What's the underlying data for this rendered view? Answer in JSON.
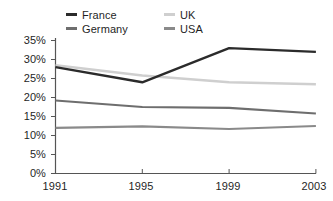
{
  "chart_data": {
    "type": "line",
    "title": "",
    "subtitle": "",
    "xlabel": "",
    "ylabel": "",
    "x": [
      "1991",
      "1995",
      "1999",
      "2003"
    ],
    "categories": [
      "1991",
      "1995",
      "1999",
      "2003"
    ],
    "series": [
      {
        "name": "France",
        "values": [
          28.0,
          24.0,
          33.0,
          32.0
        ],
        "color": "#2b2b2b"
      },
      {
        "name": "UK",
        "values": [
          28.5,
          25.8,
          24.0,
          23.5
        ],
        "color": "#cfcfcf"
      },
      {
        "name": "Germany",
        "values": [
          19.2,
          17.5,
          17.3,
          15.8
        ],
        "color": "#6e6e6e"
      },
      {
        "name": "USA",
        "values": [
          12.0,
          12.4,
          11.7,
          12.5
        ],
        "color": "#8a8a8a"
      }
    ],
    "ylim": [
      0,
      35
    ],
    "yticks": [
      0,
      5,
      10,
      15,
      20,
      25,
      30,
      35
    ],
    "ytick_labels": [
      "0%",
      "5%",
      "10%",
      "15%",
      "20%",
      "25%",
      "30%",
      "35%"
    ],
    "xtick_labels": [
      "1991",
      "1995",
      "1999",
      "2003"
    ],
    "grid": false,
    "legend_position": "top",
    "axis_color": "#555555",
    "units": "percent"
  },
  "legend": {
    "entries": [
      {
        "label": "France",
        "swatch": "legend-swatch-france"
      },
      {
        "label": "Germany",
        "swatch": "legend-swatch-germany"
      },
      {
        "label": "UK",
        "swatch": "legend-swatch-uk"
      },
      {
        "label": "USA",
        "swatch": "legend-swatch-usa"
      }
    ]
  }
}
